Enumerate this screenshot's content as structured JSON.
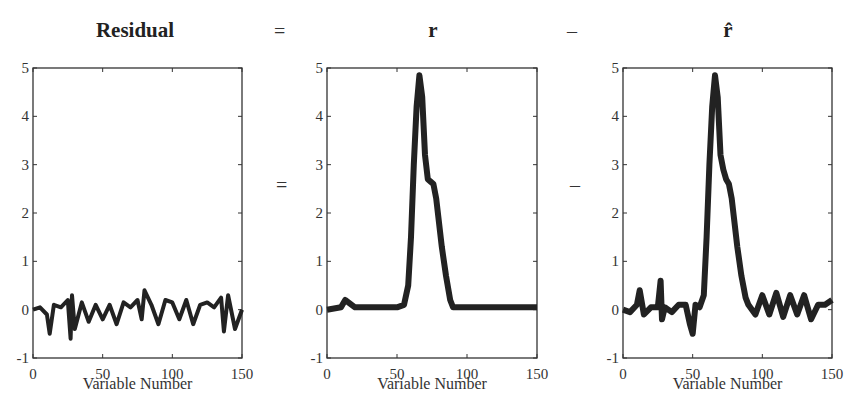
{
  "equation": {
    "titles": [
      "Residual",
      "r",
      "r̂"
    ],
    "operators_top": [
      "=",
      "–"
    ],
    "operators_mid": [
      "=",
      "–"
    ]
  },
  "chart_data": [
    {
      "type": "line",
      "title": "Residual",
      "xlabel": "Variable Number",
      "ylabel": "",
      "xlim": [
        0,
        150
      ],
      "ylim": [
        -1,
        5
      ],
      "xticks": [
        0,
        50,
        100,
        150
      ],
      "yticks": [
        -1,
        0,
        1,
        2,
        3,
        4,
        5
      ],
      "grid": false,
      "description": "Noise band around 0 with spikes roughly between -0.5 and +0.4",
      "x": [
        0,
        5,
        10,
        12,
        15,
        20,
        25,
        27,
        28,
        30,
        35,
        40,
        45,
        50,
        55,
        60,
        65,
        70,
        75,
        78,
        80,
        85,
        90,
        95,
        100,
        105,
        110,
        115,
        120,
        125,
        130,
        135,
        137,
        140,
        145,
        150
      ],
      "values": [
        0,
        0.05,
        -0.1,
        -0.5,
        0.1,
        0.05,
        0.2,
        -0.6,
        0.3,
        -0.4,
        0.15,
        -0.25,
        0.1,
        -0.2,
        0.1,
        -0.3,
        0.15,
        0.05,
        0.2,
        -0.2,
        0.4,
        0.1,
        -0.3,
        0.2,
        0.15,
        -0.2,
        0.2,
        -0.3,
        0.1,
        0.15,
        0.05,
        0.25,
        -0.45,
        0.3,
        -0.4,
        0
      ]
    },
    {
      "type": "line",
      "title": "r",
      "xlabel": "Variable Number",
      "xlim": [
        0,
        150
      ],
      "ylim": [
        -1,
        5
      ],
      "xticks": [
        0,
        50,
        100,
        150
      ],
      "yticks": [
        -1,
        0,
        1,
        2,
        3,
        4,
        5
      ],
      "grid": false,
      "description": "Peak near variable 66 reaching ~4.85, shoulder ~2.7 near 75, baseline ~0",
      "x": [
        0,
        10,
        13,
        20,
        30,
        40,
        50,
        55,
        58,
        60,
        62,
        64,
        66,
        68,
        70,
        72,
        74,
        76,
        78,
        80,
        82,
        85,
        88,
        90,
        95,
        100,
        110,
        120,
        130,
        140,
        150
      ],
      "values": [
        0,
        0.05,
        0.2,
        0.05,
        0.05,
        0.05,
        0.05,
        0.1,
        0.5,
        1.5,
        3.0,
        4.2,
        4.85,
        4.4,
        3.2,
        2.7,
        2.65,
        2.6,
        2.3,
        1.8,
        1.3,
        0.7,
        0.2,
        0.05,
        0.05,
        0.05,
        0.05,
        0.05,
        0.05,
        0.05,
        0.05
      ]
    },
    {
      "type": "line",
      "title": "r̂",
      "xlabel": "Variable Number",
      "xlim": [
        0,
        150
      ],
      "ylim": [
        -1,
        5
      ],
      "xticks": [
        0,
        50,
        100,
        150
      ],
      "yticks": [
        -1,
        0,
        1,
        2,
        3,
        4,
        5
      ],
      "grid": false,
      "description": "Same peak shape as r (~4.85 at 66) with more noise on baseline",
      "x": [
        0,
        5,
        10,
        12,
        15,
        20,
        25,
        27,
        28,
        30,
        35,
        40,
        45,
        48,
        50,
        52,
        55,
        58,
        60,
        62,
        64,
        66,
        68,
        70,
        72,
        74,
        76,
        78,
        80,
        82,
        85,
        88,
        90,
        95,
        100,
        105,
        110,
        115,
        120,
        125,
        130,
        135,
        140,
        145,
        150
      ],
      "values": [
        0,
        -0.05,
        0.1,
        0.4,
        -0.1,
        0.05,
        0.05,
        0.6,
        -0.2,
        0.05,
        -0.05,
        0.1,
        0.1,
        -0.3,
        -0.5,
        0.1,
        0.05,
        0.3,
        1.5,
        3.0,
        4.2,
        4.85,
        4.4,
        3.2,
        2.9,
        2.7,
        2.6,
        2.3,
        1.8,
        1.3,
        0.7,
        0.25,
        0.1,
        -0.1,
        0.3,
        -0.1,
        0.35,
        -0.15,
        0.3,
        -0.1,
        0.3,
        -0.2,
        0.1,
        0.1,
        0.2
      ]
    }
  ]
}
